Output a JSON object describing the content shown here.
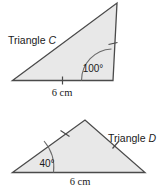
{
  "figure": {
    "background_color": "#ffffff",
    "fill_color": "#e8e8e8",
    "stroke_color": "#4a4a4a"
  },
  "triangle_c": {
    "name_label": "Triangle ",
    "name_letter": "C",
    "angle_label": "100°",
    "base_label": "6 cm",
    "tick_marks": 2
  },
  "triangle_d": {
    "name_label": "Triangle ",
    "name_letter": "D",
    "angle_label": "40°",
    "base_label": "6 cm",
    "tick_marks": 2
  }
}
